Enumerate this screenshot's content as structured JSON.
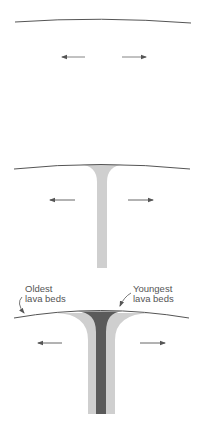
{
  "colors": {
    "background": "#ffffff",
    "surface_line": "#555555",
    "arrow": "#555555",
    "old_lava": "#cfcfcf",
    "young_lava": "#5a5a5a",
    "label_text": "#555555"
  },
  "panels": [
    {
      "id": "stage-1",
      "description": "Ridge with plates beginning to separate"
    },
    {
      "id": "stage-2",
      "description": "Magma rises through the conduit and spreads along the surface"
    },
    {
      "id": "stage-3",
      "description": "Older lava beds are carried outward and younger lava fills the center"
    }
  ],
  "labels": {
    "oldest_line1": "Oldest",
    "oldest_line2": "lava beds",
    "youngest_line1": "Youngest",
    "youngest_line2": "lava beds"
  },
  "icons": {
    "arrow_left": "arrow-left-icon",
    "arrow_right": "arrow-right-icon"
  }
}
